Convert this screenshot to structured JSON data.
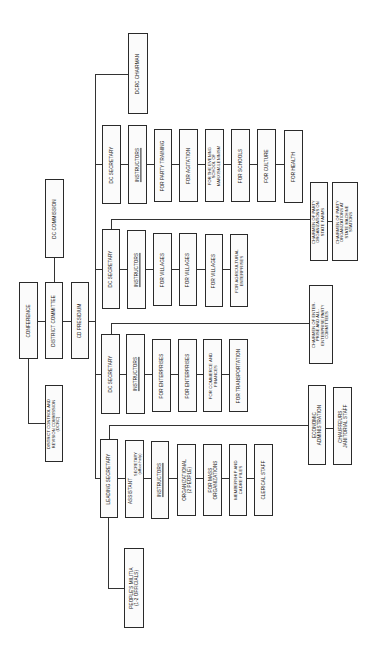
{
  "diagram": {
    "type": "organizational-chart",
    "orientation": "rotated-90-ccw",
    "top_bodies": {
      "conference": "CONFERENCE",
      "district_committee": "DISTRICT COMMITTEE",
      "cd_presidium": "CD PRESIDIUM",
      "dc_commission": "DC COMMISSION",
      "dcrc": "DISTRICT CONTROL AND\nREVISION COMMISSION\n(DCRC)",
      "dcrc_chairman": "DCRC CHAIRMAN"
    },
    "branches": [
      {
        "head": "DC SECRETARY",
        "instructors": "INSTRUCTORS",
        "sections": [
          "FOR PARTY TRAINING",
          "FOR AGITATION",
          "FOR THE EVENING\nSCHOOL OF\nMARXISM-LENINISM",
          "FOR SCHOOLS",
          "FOR CULTURE",
          "FOR HEALTH"
        ],
        "attached": [
          "CHAIRMEN OF PARTY\nORGANIZATIONS ON\nSTATE FARMS",
          "CHAIRMEN OF PARTY\nORGANIZATIONS AT\nSTATE MACHINE\nSTATIONS"
        ]
      },
      {
        "head": "DC SECRETARY",
        "instructors": "INSTRUCTORS",
        "sections": [
          "FOR VILLAGES",
          "FOR VILLAGES",
          "FOR VILLAGES",
          "FOR AGRICULTURAL\nENTERPRISES"
        ],
        "attached": [
          "CHAIRMEN OF ENTER-\nPRISE AND ALL-\nENTERPRISE PARTY\nCOMMITTEES"
        ]
      },
      {
        "head": "DC SECRETARY",
        "instructors": "INSTRUCTORS",
        "sections": [
          "FOR ENTERPRISES",
          "FOR ENTERPRISES",
          "FOR COMMERCE AND\nFINANCES",
          "FOR TRANSPORTATION"
        ],
        "attached": []
      },
      {
        "head": "LEADING SECRETARY",
        "assistant": "ASSISTANT",
        "secretary": "SECRETARY\n(office help)",
        "instructors": "INSTRUCTORS",
        "sections": [
          "ORGANIZATIONAL\n(2 PEOPLE)",
          "FOR MASS\nORGANIZATIONS",
          "MEMBERSHIP AND\nCADRE FILES",
          "CLERICAL STAFF"
        ],
        "attached": [
          "ECONOMIC\nADMINISTRATION",
          "CHAUFFEURS,\nJANITORIAL STAFF"
        ],
        "below": "PEOPLE'S MILITIA\n(1-2 OFFICIALS)"
      }
    ]
  }
}
